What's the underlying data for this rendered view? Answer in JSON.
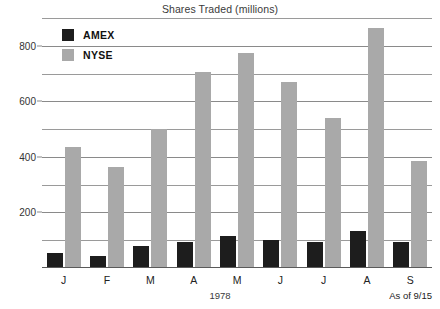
{
  "chart_data": {
    "type": "bar",
    "title": "Shares Traded (millions)",
    "xlabel": "1978",
    "ylabel": "",
    "categories": [
      "J",
      "F",
      "M",
      "A",
      "M",
      "J",
      "J",
      "A",
      "S"
    ],
    "series": [
      {
        "name": "AMEX",
        "color": "#1d1d1d",
        "values": [
          55,
          45,
          80,
          95,
          115,
          100,
          95,
          135,
          95
        ]
      },
      {
        "name": "NYSE",
        "color": "#a9a9a9",
        "values": [
          435,
          365,
          500,
          705,
          775,
          670,
          540,
          865,
          385
        ]
      }
    ],
    "ylim": [
      0,
      900
    ],
    "yticks": [
      200,
      400,
      600,
      800
    ],
    "gridlines": [
      100,
      200,
      300,
      400,
      500,
      600,
      700,
      800,
      900
    ],
    "grid": true,
    "legend_position": "top-left-inside",
    "annotation": "As of 9/15"
  },
  "legend": {
    "items": [
      {
        "label": "AMEX",
        "swatch": "amex-swatch"
      },
      {
        "label": "NYSE",
        "swatch": "nyse-swatch"
      }
    ]
  },
  "axis": {
    "ytick_labels": [
      "800",
      "600",
      "400",
      "200"
    ],
    "xtick_labels": [
      "J",
      "F",
      "M",
      "A",
      "M",
      "J",
      "J",
      "A",
      "S"
    ],
    "x_axis_title": "1978"
  },
  "footnote": "As of 9/15"
}
